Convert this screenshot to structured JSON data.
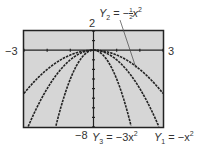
{
  "chart_data": {
    "type": "line",
    "title": "",
    "xlabel": "",
    "ylabel": "",
    "xlim": [
      -3,
      3
    ],
    "ylim": [
      -8,
      2
    ],
    "xtick_labels": {
      "min": "−3",
      "max": "3"
    },
    "ytick_labels": {
      "min": "−8",
      "max": "2"
    },
    "grid": false,
    "background": "#d6d6d6",
    "series": [
      {
        "name": "Y1 = −x²",
        "expr": "-x^2"
      },
      {
        "name": "Y2 = −½x²",
        "expr": "-0.5*x^2"
      },
      {
        "name": "Y3 = −3x²",
        "expr": "-3*x^2"
      }
    ],
    "annotations": [
      {
        "text": "Y2 = −½x²",
        "points_to": "Y2",
        "position": "top-right"
      },
      {
        "text": "Y3 = −3x²",
        "position": "bottom"
      },
      {
        "text": "Y1 = −x²",
        "position": "bottom-right"
      }
    ]
  },
  "labels": {
    "xmin": "−3",
    "xmax": "3",
    "ymax": "2",
    "ymin": "−8",
    "y2_lhs": "Y",
    "y2_sub": "2",
    "y2_rhs": "= −",
    "y2_frac_num": "1",
    "y2_frac_den": "2",
    "y2_var": "x",
    "y2_exp": "2",
    "y3_lhs": "Y",
    "y3_sub": "3",
    "y3_rhs": "= −3x",
    "y3_exp": "2",
    "y1_lhs": "Y",
    "y1_sub": "1",
    "y1_rhs": "= −x",
    "y1_exp": "2"
  }
}
